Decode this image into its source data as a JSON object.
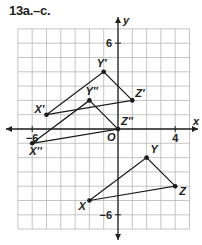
{
  "title": "13a.–c.",
  "graph": {
    "axis_labels": {
      "x": "x",
      "y": "y",
      "origin": "O"
    },
    "tick_labels": [
      {
        "text": "6",
        "axis": "y",
        "value": 6
      },
      {
        "text": "−6",
        "axis": "y",
        "value": -6
      },
      {
        "text": "−6",
        "axis": "x",
        "value": -6
      },
      {
        "text": "4",
        "axis": "x",
        "value": 4
      }
    ],
    "grid": {
      "xmin": -7,
      "xmax": 5,
      "ymin": -7,
      "ymax": 7,
      "unit_px": 14.3
    },
    "colors": {
      "grid": "#b8b8b8",
      "axis": "#222222",
      "line": "#1a1a1a"
    }
  },
  "triangles": [
    {
      "name": "XYZ",
      "points": [
        {
          "label": "X",
          "x": -2,
          "y": -5
        },
        {
          "label": "Y",
          "x": 2,
          "y": -2
        },
        {
          "label": "Z",
          "x": 4,
          "y": -4
        }
      ]
    },
    {
      "name": "X'Y'Z'",
      "points": [
        {
          "label": "X'",
          "x": -5,
          "y": 1
        },
        {
          "label": "Y'",
          "x": -1,
          "y": 4
        },
        {
          "label": "Z'",
          "x": 1,
          "y": 2
        }
      ]
    },
    {
      "name": "X''Y''Z''",
      "points": [
        {
          "label": "X''",
          "x": -6,
          "y": -1
        },
        {
          "label": "Y''",
          "x": -2,
          "y": 2
        },
        {
          "label": "Z''",
          "x": 0,
          "y": 0
        }
      ]
    }
  ]
}
